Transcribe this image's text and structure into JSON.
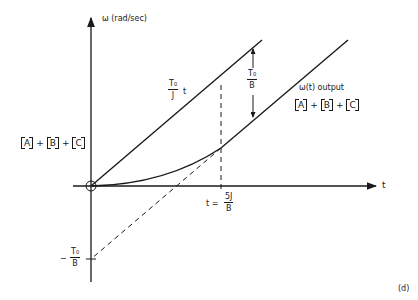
{
  "diagram": {
    "y_axis_label": "ω (rad/sec)",
    "x_axis_label": "t",
    "panel_label": "(d)",
    "upper_line_label": {
      "numerator": "T₀",
      "denominator": "J",
      "suffix": "t"
    },
    "gap_label": {
      "numerator": "T₀",
      "denominator": "B"
    },
    "output_label": "ω(t) output",
    "sum_left": {
      "terms": [
        "A",
        "B",
        "C"
      ],
      "operator": "+"
    },
    "sum_right": {
      "terms": [
        "A",
        "B",
        "C"
      ],
      "operator": "+"
    },
    "time_marker": {
      "prefix": "t =",
      "numerator": "5J",
      "denominator": "B"
    },
    "intercept_label": {
      "sign": "−",
      "numerator": "T₀",
      "denominator": "B"
    }
  }
}
